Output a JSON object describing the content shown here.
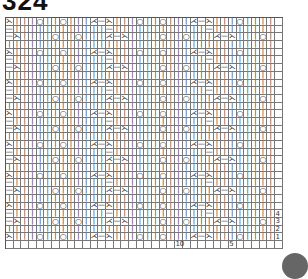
{
  "title": "324",
  "grid": {
    "cols": 36,
    "rows": 30,
    "cell_w": 7.7,
    "cell_h": 7.7,
    "symbols": {
      "k": "|",
      "p": "—",
      "yo": "○",
      "ssk": "⋋",
      "k2tog": "⋌",
      "blank": " "
    },
    "row_patterns": {
      "A": [
        "ssk",
        "k",
        "k",
        "k",
        "yo",
        "k",
        "k",
        "yo",
        "k",
        "k",
        "k",
        "k2tog",
        "p",
        "ssk",
        "k",
        "k",
        "k",
        "yo",
        "k",
        "k",
        "yo",
        "k",
        "k",
        "k",
        "k2tog",
        "p",
        "ssk",
        "k",
        "k",
        "k",
        "yo",
        "k",
        "k",
        "k",
        "k",
        "blank"
      ],
      "B": [
        "p",
        "k",
        "k",
        "k",
        "k",
        "k",
        "k",
        "k",
        "k",
        "k",
        "k",
        "k",
        "k",
        "p",
        "k",
        "k",
        "k",
        "k",
        "k",
        "k",
        "k",
        "k",
        "k",
        "k",
        "k",
        "k",
        "p",
        "k",
        "k",
        "k",
        "k",
        "k",
        "k",
        "k",
        "k",
        "blank"
      ],
      "C": [
        "p",
        "ssk",
        "k",
        "k",
        "k",
        "k",
        "yo",
        "k",
        "k",
        "yo",
        "k",
        "k",
        "k",
        "k2tog",
        "p",
        "ssk",
        "k",
        "k",
        "k",
        "k",
        "yo",
        "k",
        "k",
        "yo",
        "k",
        "k",
        "k",
        "k2tog",
        "p",
        "ssk",
        "k",
        "k",
        "k",
        "yo",
        "k",
        "blank"
      ],
      "D": [
        "k",
        "k",
        "k",
        "k",
        "k",
        "k",
        "k",
        "k",
        "k",
        "k",
        "k",
        "k",
        "k",
        "k",
        "k",
        "k",
        "k",
        "k",
        "k",
        "k",
        "k",
        "k",
        "k",
        "k",
        "k",
        "k",
        "k",
        "k",
        "k",
        "k",
        "k",
        "k",
        "k",
        "k",
        "k",
        "blank"
      ]
    },
    "row_sequence": [
      "A",
      "B",
      "C",
      "D",
      "A",
      "B",
      "C",
      "D",
      "A",
      "B",
      "C",
      "D",
      "A",
      "B",
      "C",
      "D",
      "A",
      "B",
      "C",
      "D",
      "A",
      "B",
      "C",
      "D",
      "A",
      "B",
      "C",
      "D",
      "A",
      "blank"
    ]
  },
  "row_numbers": [
    "1",
    "2",
    "3",
    "4"
  ],
  "col_numbers": [
    {
      "label": "10",
      "col": 22
    },
    {
      "label": "5",
      "col": 29
    }
  ]
}
